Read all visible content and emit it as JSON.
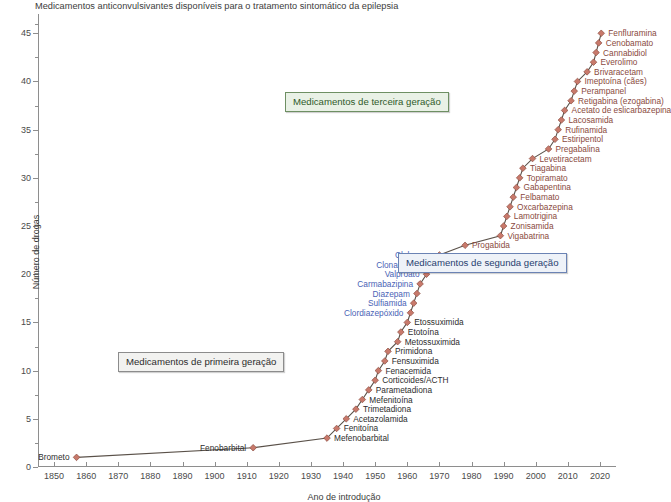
{
  "chart_data": {
    "type": "line",
    "title": "Medicamentos anticonvulsivantes disponíveis para o tratamento sintomático da epilepsia",
    "xlabel": "Ano de introdução",
    "ylabel": "Número de drogas",
    "xlim": [
      1845,
      2025
    ],
    "ylim": [
      0,
      47
    ],
    "grid": false,
    "legend": "none",
    "marker_color": "#c8796b",
    "line_color": "#5a5149",
    "x_ticks": [
      1850,
      1860,
      1870,
      1880,
      1890,
      1900,
      1910,
      1920,
      1930,
      1940,
      1950,
      1960,
      1970,
      1980,
      1990,
      2000,
      2010,
      2020
    ],
    "y_ticks_major": [
      0,
      5,
      10,
      15,
      20,
      25,
      30,
      35,
      40,
      45
    ],
    "y_ticks_minor": [
      2.5,
      7.5,
      12.5,
      17.5,
      22.5,
      27.5,
      32.5,
      37.5,
      42.5,
      46
    ],
    "series_name": "Número cumulativo de anticonvulsivantes",
    "points": [
      {
        "year": 1857,
        "count": 1,
        "label": "Brometo",
        "gen": 1,
        "side": "left"
      },
      {
        "year": 1912,
        "count": 2,
        "label": "Fenobarbital",
        "gen": 1,
        "side": "left"
      },
      {
        "year": 1935,
        "count": 3,
        "label": "Mefenobarbital",
        "gen": 1,
        "side": "right"
      },
      {
        "year": 1938,
        "count": 4,
        "label": "Fenitoína",
        "gen": 1,
        "side": "right"
      },
      {
        "year": 1941,
        "count": 5,
        "label": "Acetazolamida",
        "gen": 1,
        "side": "right"
      },
      {
        "year": 1944,
        "count": 6,
        "label": "Trimetadiona",
        "gen": 1,
        "side": "right"
      },
      {
        "year": 1946,
        "count": 7,
        "label": "Mefenitoína",
        "gen": 1,
        "side": "right"
      },
      {
        "year": 1948,
        "count": 8,
        "label": "Parametadiona",
        "gen": 1,
        "side": "right"
      },
      {
        "year": 1950,
        "count": 9,
        "label": "Corticoides/ACTH",
        "gen": 1,
        "side": "right"
      },
      {
        "year": 1951,
        "count": 10,
        "label": "Fenacemida",
        "gen": 1,
        "side": "right"
      },
      {
        "year": 1953,
        "count": 11,
        "label": "Fensuximida",
        "gen": 1,
        "side": "right"
      },
      {
        "year": 1954,
        "count": 12,
        "label": "Primidona",
        "gen": 1,
        "side": "right"
      },
      {
        "year": 1957,
        "count": 13,
        "label": "Metossuximida",
        "gen": 1,
        "side": "right"
      },
      {
        "year": 1958,
        "count": 14,
        "label": "Etotoína",
        "gen": 1,
        "side": "right"
      },
      {
        "year": 1960,
        "count": 15,
        "label": "Etossuximida",
        "gen": 1,
        "side": "right"
      },
      {
        "year": 1961,
        "count": 16,
        "label": "Clordiazepóxido",
        "gen": 2,
        "side": "left"
      },
      {
        "year": 1962,
        "count": 17,
        "label": "Sulfiamida",
        "gen": 2,
        "side": "left"
      },
      {
        "year": 1963,
        "count": 18,
        "label": "Diazepam",
        "gen": 2,
        "side": "left"
      },
      {
        "year": 1964,
        "count": 19,
        "label": "Carmabazipina",
        "gen": 2,
        "side": "left"
      },
      {
        "year": 1966,
        "count": 20,
        "label": "Valproato",
        "gen": 2,
        "side": "left"
      },
      {
        "year": 1967,
        "count": 21,
        "label": "Clonazepam",
        "gen": 2,
        "side": "left"
      },
      {
        "year": 1970,
        "count": 22,
        "label": "Clobazam",
        "gen": 2,
        "side": "left"
      },
      {
        "year": 1978,
        "count": 23,
        "label": "Progabida",
        "gen": 3,
        "side": "right"
      },
      {
        "year": 1989,
        "count": 24,
        "label": "Vigabatrina",
        "gen": 3,
        "side": "right"
      },
      {
        "year": 1990,
        "count": 25,
        "label": "Zonisamida",
        "gen": 3,
        "side": "right"
      },
      {
        "year": 1991,
        "count": 26,
        "label": "Lamotrigina",
        "gen": 3,
        "side": "right"
      },
      {
        "year": 1992,
        "count": 27,
        "label": "Oxcarbazepina",
        "gen": 3,
        "side": "right"
      },
      {
        "year": 1993,
        "count": 28,
        "label": "Felbamato",
        "gen": 3,
        "side": "right"
      },
      {
        "year": 1994,
        "count": 29,
        "label": "Gabapentina",
        "gen": 3,
        "side": "right"
      },
      {
        "year": 1995,
        "count": 30,
        "label": "Topiramato",
        "gen": 3,
        "side": "right"
      },
      {
        "year": 1996,
        "count": 31,
        "label": "Tiagabina",
        "gen": 3,
        "side": "right"
      },
      {
        "year": 1999,
        "count": 32,
        "label": "Levetiracetam",
        "gen": 3,
        "side": "right"
      },
      {
        "year": 2004,
        "count": 33,
        "label": "Pregabalina",
        "gen": 3,
        "side": "right"
      },
      {
        "year": 2006,
        "count": 34,
        "label": "Estiripentol",
        "gen": 3,
        "side": "right"
      },
      {
        "year": 2007,
        "count": 35,
        "label": "Rufinamida",
        "gen": 3,
        "side": "right"
      },
      {
        "year": 2008,
        "count": 36,
        "label": "Lacosamida",
        "gen": 3,
        "side": "right"
      },
      {
        "year": 2009,
        "count": 37,
        "label": "Acetato de eslicarbazepina",
        "gen": 3,
        "side": "right"
      },
      {
        "year": 2011,
        "count": 38,
        "label": "Retigabina (ezogabina)",
        "gen": 3,
        "side": "right"
      },
      {
        "year": 2012,
        "count": 39,
        "label": "Perampanel",
        "gen": 3,
        "side": "right"
      },
      {
        "year": 2013,
        "count": 40,
        "label": "Imeptoína (cães)",
        "gen": 3,
        "side": "right"
      },
      {
        "year": 2016,
        "count": 41,
        "label": "Brivaracetam",
        "gen": 3,
        "side": "right"
      },
      {
        "year": 2018,
        "count": 42,
        "label": "Everolimo",
        "gen": 3,
        "side": "right"
      },
      {
        "year": 2018.8,
        "count": 43,
        "label": "Cannabidiol",
        "gen": 3,
        "side": "right"
      },
      {
        "year": 2019.6,
        "count": 44,
        "label": "Cenobamato",
        "gen": 3,
        "side": "right"
      },
      {
        "year": 2020.4,
        "count": 45,
        "label": "Fenfluramina",
        "gen": 3,
        "side": "right"
      }
    ],
    "annotations": [
      {
        "text": "Medicamentos de terceira geração",
        "gen": 3,
        "x": 285,
        "y": 92
      },
      {
        "text": "Medicamentos de segunda geração",
        "gen": 2,
        "x": 398,
        "y": 253
      },
      {
        "text": "Medicamentos de primeira geração",
        "gen": 1,
        "x": 118,
        "y": 352
      }
    ]
  }
}
